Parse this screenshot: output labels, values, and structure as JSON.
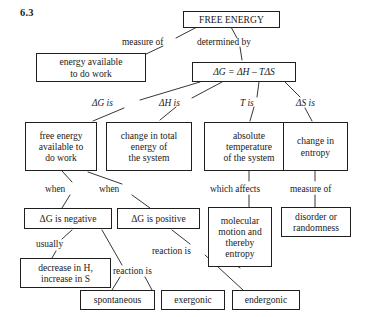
{
  "figure": {
    "number": "6.3",
    "type": "concept-map"
  },
  "nodes": [
    {
      "id": "free-energy",
      "label": "FREE ENERGY"
    },
    {
      "id": "energy-available",
      "label": "energy available\nto do work"
    },
    {
      "id": "gibbs-equation",
      "label": "ΔG =  ΔH – TΔS"
    },
    {
      "id": "free-energy-work",
      "label": "free energy\navailable to\ndo work"
    },
    {
      "id": "change-total-energy",
      "label": "change in total\nenergy of\nthe system"
    },
    {
      "id": "absolute-temp",
      "label": "absolute\ntemperature\nof the system"
    },
    {
      "id": "change-entropy",
      "label": "change in\nentropy"
    },
    {
      "id": "delta-g-negative",
      "label": "ΔG is negative"
    },
    {
      "id": "delta-g-positive",
      "label": "ΔG is positive"
    },
    {
      "id": "molecular-motion",
      "label": "molecular\nmotion and\nthereby\nentropy"
    },
    {
      "id": "disorder",
      "label": "disorder or\nrandomness"
    },
    {
      "id": "decrease-h",
      "label": "decrease in H,\nincrease in S"
    },
    {
      "id": "spontaneous",
      "label": "spontaneous"
    },
    {
      "id": "exergonic",
      "label": "exergonic"
    },
    {
      "id": "endergonic",
      "label": "endergonic"
    }
  ],
  "edge_labels": [
    {
      "id": "measure-of-top",
      "label": "measure of"
    },
    {
      "id": "determined-by",
      "label": "determined by"
    },
    {
      "id": "delta-g-is",
      "label": "ΔG is"
    },
    {
      "id": "delta-h-is",
      "label": "ΔH is"
    },
    {
      "id": "t-is",
      "label": "T is"
    },
    {
      "id": "delta-s-is",
      "label": "ΔS is"
    },
    {
      "id": "when-left",
      "label": "when"
    },
    {
      "id": "when-right",
      "label": "when"
    },
    {
      "id": "which-affects",
      "label": "which affects"
    },
    {
      "id": "measure-of-right",
      "label": "measure of"
    },
    {
      "id": "usually",
      "label": "usually"
    },
    {
      "id": "reaction-is-left",
      "label": "reaction is"
    },
    {
      "id": "reaction-is-right",
      "label": "reaction is"
    }
  ],
  "colors": {
    "box_border": "#1f1f1f",
    "text": "#1a1a1a",
    "background": "#ffffff",
    "connector": "#2b2b2b"
  }
}
